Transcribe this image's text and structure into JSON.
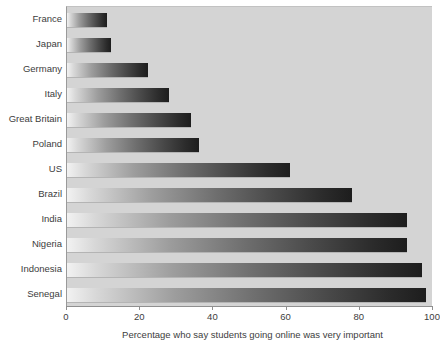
{
  "chart_data": {
    "type": "bar",
    "orientation": "horizontal",
    "title": "",
    "subtitle": "",
    "caption": "Percentage who say students going online was very important",
    "xlabel": "",
    "ylabel": "",
    "xlim": [
      0,
      100
    ],
    "grid": false,
    "legend": false,
    "categories": [
      "France",
      "Japan",
      "Germany",
      "Italy",
      "Great Britain",
      "Poland",
      "US",
      "Brazil",
      "India",
      "Nigeria",
      "Indonesia",
      "Senegal"
    ],
    "values": [
      11,
      12,
      22,
      28,
      34,
      36,
      61,
      78,
      93,
      93,
      97,
      98
    ],
    "xticks": [
      0,
      20,
      40,
      60,
      80,
      100
    ],
    "xtick_labels": [
      "0",
      "20",
      "40",
      "60",
      "80",
      "100"
    ]
  },
  "style": {
    "plot_background": "#d4d4d4",
    "page_background": "#ffffff",
    "bar_light": "#f2f2f2",
    "bar_dark": "#1d1d1d",
    "axis_color": "#8f8f8f",
    "text_color": "#3d3d3d"
  }
}
